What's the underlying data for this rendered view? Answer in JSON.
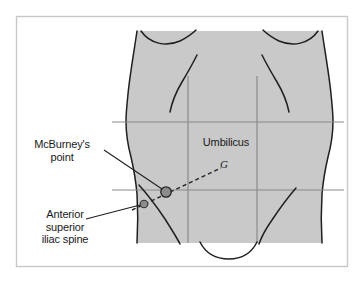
{
  "figure": {
    "background_color": "#ffffff",
    "frame": {
      "border_color": "#c8c8c8",
      "x": 16,
      "y": 16,
      "width": 332,
      "height": 251
    },
    "body": {
      "fill_color": "#c9c9c9",
      "outline_color": "#1a1a1a",
      "description": "anterior abdominal wall torso silhouette"
    },
    "grid": {
      "line_color": "#8a8a8a",
      "horizontal_lines": [
        {
          "name": "transpyloric-line",
          "y": 122,
          "x_start": 112,
          "x_end": 344
        },
        {
          "name": "transtubercular-line",
          "y": 190,
          "x_start": 112,
          "x_end": 344
        }
      ],
      "vertical_lines": [
        {
          "name": "left-midclavicular-line",
          "x": 188,
          "y_start": 76,
          "y_end": 243
        },
        {
          "name": "right-midclavicular-line",
          "x": 257,
          "y_start": 76,
          "y_end": 243
        }
      ]
    },
    "markers": [
      {
        "name": "mcburneys-point-marker",
        "cx": 166,
        "cy": 192,
        "r": 5.2,
        "fill": "#8c8c8c",
        "stroke": "#222222"
      },
      {
        "name": "asis-marker",
        "cx": 144,
        "cy": 204,
        "r": 3.8,
        "fill": "#8c8c8c",
        "stroke": "#333333"
      }
    ],
    "dashed_line": {
      "name": "asis-to-umbilicus-line",
      "x1": 132,
      "y1": 210,
      "x2": 221,
      "y2": 168,
      "color": "#222222",
      "dash": "4 3"
    },
    "umbilicus_glyph": "G"
  },
  "labels": {
    "mcburney": {
      "text": "McBurney's\npoint",
      "leader": {
        "x1": 104,
        "y1": 150,
        "x2": 162,
        "y2": 189
      }
    },
    "asis": {
      "text": "Anterior\nsuperior\niliac spine",
      "leader": {
        "x1": 86,
        "y1": 219,
        "x2": 140,
        "y2": 205
      }
    },
    "umbilicus": {
      "text": "Umbilicus"
    }
  }
}
